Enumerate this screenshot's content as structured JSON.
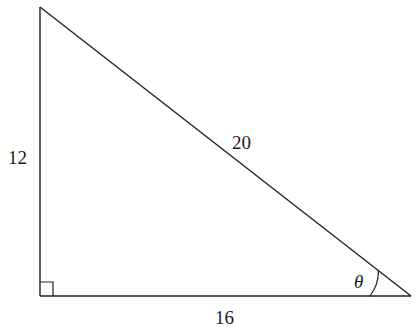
{
  "diagram": {
    "type": "right-triangle",
    "vertices": {
      "top": {
        "x": 40,
        "y": 7
      },
      "right_angle": {
        "x": 40,
        "y": 296
      },
      "bottom_right": {
        "x": 411,
        "y": 296
      }
    },
    "sides": {
      "vertical_leg": {
        "label": "12"
      },
      "hypotenuse": {
        "label": "20"
      },
      "horizontal_leg": {
        "label": "16"
      }
    },
    "angle": {
      "label": "θ",
      "location": "bottom-right vertex"
    },
    "right_angle_marker": true,
    "colors": {
      "stroke": "#222222",
      "text": "#1a1a1a",
      "background": "#ffffff"
    }
  }
}
